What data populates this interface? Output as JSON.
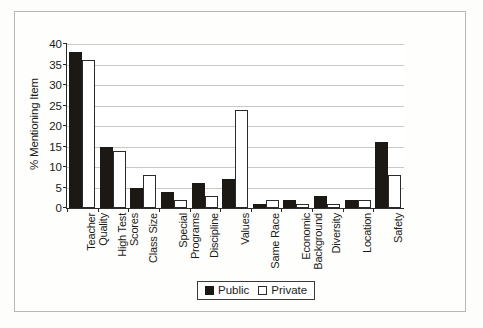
{
  "chart_data": {
    "type": "bar",
    "title": "",
    "xlabel": "",
    "ylabel": "% Mentioning Item",
    "ylim": [
      0,
      40
    ],
    "yticks": [
      0,
      5,
      10,
      15,
      20,
      25,
      30,
      35,
      40
    ],
    "grid": true,
    "legend_position": "bottom",
    "categories": [
      "Teacher Quality",
      "High Test Scores",
      "Class Size",
      "Special Programs",
      "Discipline",
      "Values",
      "Same Race",
      "Economic Background",
      "Diversity",
      "Location",
      "Safety"
    ],
    "category_lines": [
      [
        "Teacher",
        "Quality"
      ],
      [
        "High Test",
        "Scores"
      ],
      [
        "Class Size"
      ],
      [
        "Special",
        "Programs"
      ],
      [
        "Discipline"
      ],
      [
        "Values"
      ],
      [
        "Same Race"
      ],
      [
        "Economic",
        "Background"
      ],
      [
        "Diversity"
      ],
      [
        "Location"
      ],
      [
        "Safety"
      ]
    ],
    "series": [
      {
        "name": "Public",
        "color": "#1c1814",
        "values": [
          38,
          15,
          5,
          4,
          6,
          7,
          1,
          2,
          3,
          2,
          16
        ]
      },
      {
        "name": "Private",
        "color": "#ffffff",
        "values": [
          36,
          14,
          8,
          2,
          3,
          24,
          2,
          1,
          1,
          2,
          8
        ]
      }
    ]
  },
  "legend": {
    "entries": [
      {
        "label": "Public"
      },
      {
        "label": "Private"
      }
    ]
  },
  "colors": {
    "public": "#1c1814",
    "private": "#ffffff",
    "axis": "#2b2b2b",
    "grid": "#c9c9c4",
    "frame": "#b9b9b4"
  }
}
